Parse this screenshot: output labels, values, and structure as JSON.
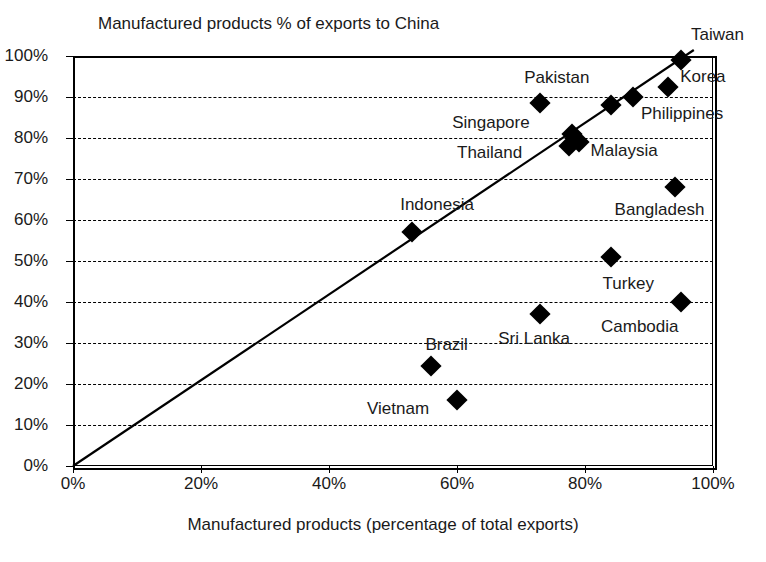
{
  "chart_data": {
    "type": "scatter",
    "title": "Manufactured products % of exports to China",
    "xlabel": "Manufactured products (percentage of total exports)",
    "ylabel": "",
    "xlim": [
      0,
      100
    ],
    "ylim": [
      0,
      100
    ],
    "grid": "horizontal-dashed",
    "legend": "none",
    "xticks": [
      "0%",
      "20%",
      "40%",
      "60%",
      "80%",
      "100%"
    ],
    "xtick_values": [
      0,
      20,
      40,
      60,
      80,
      100
    ],
    "yticks": [
      "0%",
      "10%",
      "20%",
      "30%",
      "40%",
      "50%",
      "60%",
      "70%",
      "80%",
      "90%",
      "100%"
    ],
    "ytick_values": [
      0,
      10,
      20,
      30,
      40,
      50,
      60,
      70,
      80,
      90,
      100
    ],
    "reference_line": {
      "description": "45 degree identity line y = x",
      "from": [
        0,
        0
      ],
      "to": [
        97,
        100
      ]
    },
    "points": [
      {
        "name": "Taiwan",
        "x": 95.0,
        "y": 99.0,
        "label_dx": 10,
        "label_dy": -26
      },
      {
        "name": "Korea",
        "x": 93.0,
        "y": 92.5,
        "label_dx": 12,
        "label_dy": -11
      },
      {
        "name": "Philippines",
        "x": 87.5,
        "y": 90.0,
        "label_dx": 8,
        "label_dy": 16
      },
      {
        "name": "",
        "x": 84.0,
        "y": 88.0,
        "label_dx": 0,
        "label_dy": 0
      },
      {
        "name": "Pakistan",
        "x": 73.0,
        "y": 88.5,
        "label_dx": -16,
        "label_dy": -26
      },
      {
        "name": "Singapore",
        "x": 78.0,
        "y": 81.0,
        "label_dx": -120,
        "label_dy": -12
      },
      {
        "name": "Malaysia",
        "x": 79.0,
        "y": 79.0,
        "label_dx": 12,
        "label_dy": 8
      },
      {
        "name": "Thailand",
        "x": 77.5,
        "y": 78.0,
        "label_dx": -112,
        "label_dy": 6
      },
      {
        "name": "Bangladesh",
        "x": 94.0,
        "y": 68.0,
        "label_dx": -60,
        "label_dy": 22
      },
      {
        "name": "Indonesia",
        "x": 53.0,
        "y": 57.0,
        "label_dx": -12,
        "label_dy": -28
      },
      {
        "name": "Turkey",
        "x": 84.0,
        "y": 51.0,
        "label_dx": -8,
        "label_dy": 26
      },
      {
        "name": "Cambodia",
        "x": 95.0,
        "y": 40.0,
        "label_dx": -80,
        "label_dy": 24
      },
      {
        "name": "Sri Lanka",
        "x": 73.0,
        "y": 37.0,
        "label_dx": -42,
        "label_dy": 24
      },
      {
        "name": "Brazil",
        "x": 56.0,
        "y": 24.5,
        "label_dx": -6,
        "label_dy": -22
      },
      {
        "name": "Vietnam",
        "x": 60.0,
        "y": 16.0,
        "label_dx": -90,
        "label_dy": 8
      }
    ]
  }
}
